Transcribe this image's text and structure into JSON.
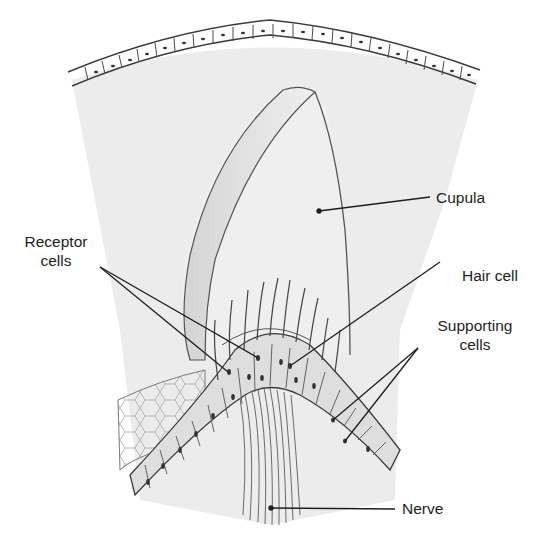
{
  "diagram": {
    "title": "",
    "colors": {
      "background": "#ffffff",
      "tissue_fill": "#ececec",
      "line": "#3a3a3a",
      "label_text": "#1e1e1e"
    },
    "labels": {
      "cupula": "Cupula",
      "receptor_line1": "Receptor",
      "receptor_line2": "cells",
      "hair_cell": "Hair cell",
      "supporting_line1": "Supporting",
      "supporting_line2": "cells",
      "nerve": "Nerve"
    },
    "leaders": [
      {
        "label": "Cupula",
        "from": [
          430,
          197
        ],
        "to": [
          319,
          211
        ]
      },
      {
        "label": "Receptor cells",
        "from": [
          100,
          267
        ],
        "to": [
          258,
          358
        ]
      },
      {
        "label": "Receptor cells",
        "from": [
          100,
          267
        ],
        "to": [
          228,
          372
        ]
      },
      {
        "label": "Hair cell",
        "from": [
          440,
          262
        ],
        "to": [
          290,
          366
        ]
      },
      {
        "label": "Supporting cells",
        "from": [
          418,
          348
        ],
        "to": [
          333,
          420
        ]
      },
      {
        "label": "Supporting cells",
        "from": [
          418,
          348
        ],
        "to": [
          345,
          441
        ]
      },
      {
        "label": "Nerve",
        "from": [
          395,
          509
        ],
        "to": [
          271,
          508
        ]
      }
    ]
  }
}
